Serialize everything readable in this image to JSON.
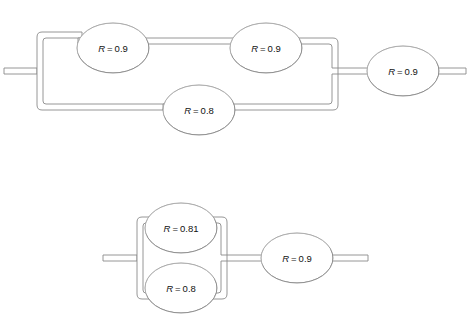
{
  "figure": {
    "kind": "reliability-block-diagram",
    "background_color": "#ffffff",
    "line_color": "#8a8a8a",
    "line_fill_color": "#ffffff",
    "shadow_color": "#000000",
    "label_color": "#111111",
    "diagram_count": 2
  },
  "diagrams": [
    {
      "id": "diagram-top",
      "name": "top-network",
      "description": "Two parallel branches feeding one series block",
      "nodes": [
        {
          "id": "t1",
          "name": "node-top-left",
          "symbol": "R",
          "equals": "=",
          "value": "0.9",
          "label": "R = 0.9",
          "cx": 113,
          "cy": 48,
          "rx": 36,
          "ry": 25
        },
        {
          "id": "t2",
          "name": "node-top-middle",
          "symbol": "R",
          "equals": "=",
          "value": "0.9",
          "label": "R = 0.9",
          "cx": 266,
          "cy": 48,
          "rx": 36,
          "ry": 25
        },
        {
          "id": "t3",
          "name": "node-bottom-mid",
          "symbol": "R",
          "equals": "=",
          "value": "0.8",
          "label": "R = 0.8",
          "cx": 199,
          "cy": 110,
          "rx": 36,
          "ry": 25
        },
        {
          "id": "t4",
          "name": "node-series-out",
          "symbol": "R",
          "equals": "=",
          "value": "0.9",
          "label": "R = 0.9",
          "cx": 403,
          "cy": 71,
          "rx": 36,
          "ry": 25
        }
      ]
    },
    {
      "id": "diagram-bottom",
      "name": "bottom-network",
      "description": "Two stacked parallel nodes feeding one series block",
      "nodes": [
        {
          "id": "b1",
          "name": "node-parallel-upper",
          "symbol": "R",
          "equals": "=",
          "value": "0.81",
          "label": "R = 0.81",
          "cx": 181,
          "cy": 228,
          "rx": 36,
          "ry": 25
        },
        {
          "id": "b2",
          "name": "node-parallel-lower",
          "symbol": "R",
          "equals": "=",
          "value": "0.8",
          "label": "R = 0.8",
          "cx": 181,
          "cy": 288,
          "rx": 36,
          "ry": 25
        },
        {
          "id": "b3",
          "name": "node-series-out",
          "symbol": "R",
          "equals": "=",
          "value": "0.9",
          "label": "R = 0.9",
          "cx": 297,
          "cy": 258,
          "rx": 36,
          "ry": 25
        }
      ]
    }
  ]
}
